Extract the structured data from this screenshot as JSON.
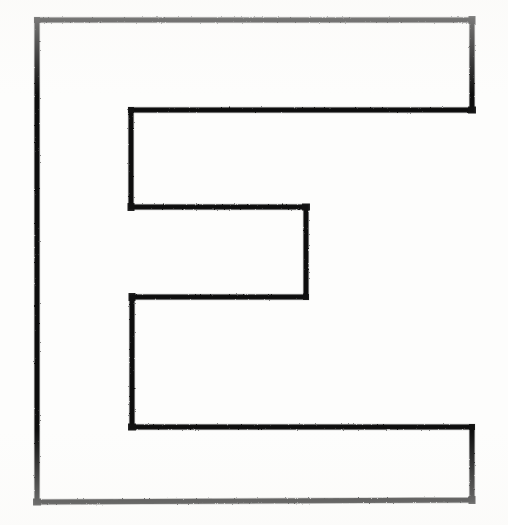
{
  "document": {
    "kind": "line-drawing",
    "title": "E-shaped outline polygon",
    "description": "Scanned black-ink outline of a comb / letter-E shaped closed polygon on white paper",
    "background_color": "#fdfdfc",
    "ink_color": "#1a1a1a",
    "canvas": {
      "width": 508,
      "height": 525
    }
  },
  "shape": {
    "name": "e-shape-polygon",
    "closed": true,
    "stroke_width": 5,
    "stroke_color": "#141414",
    "fill": "none",
    "points": [
      [
        37,
        20
      ],
      [
        472,
        20
      ],
      [
        472,
        110
      ],
      [
        131,
        110
      ],
      [
        131,
        207
      ],
      [
        306,
        207
      ],
      [
        306,
        297
      ],
      [
        132,
        297
      ],
      [
        132,
        427
      ],
      [
        472,
        427
      ],
      [
        472,
        500
      ],
      [
        37,
        502
      ]
    ],
    "segments": [
      {
        "name": "top-edge",
        "from": [
          37,
          20
        ],
        "to": [
          472,
          20
        ],
        "orientation": "horizontal"
      },
      {
        "name": "top-right-edge",
        "from": [
          472,
          20
        ],
        "to": [
          472,
          110
        ],
        "orientation": "vertical"
      },
      {
        "name": "upper-arm-underside",
        "from": [
          472,
          110
        ],
        "to": [
          131,
          110
        ],
        "orientation": "horizontal"
      },
      {
        "name": "upper-notch-left-edge",
        "from": [
          131,
          110
        ],
        "to": [
          131,
          207
        ],
        "orientation": "vertical"
      },
      {
        "name": "middle-arm-topside",
        "from": [
          131,
          207
        ],
        "to": [
          306,
          207
        ],
        "orientation": "horizontal"
      },
      {
        "name": "middle-arm-right-edge",
        "from": [
          306,
          207
        ],
        "to": [
          306,
          297
        ],
        "orientation": "vertical"
      },
      {
        "name": "middle-arm-underside",
        "from": [
          306,
          297
        ],
        "to": [
          132,
          297
        ],
        "orientation": "horizontal"
      },
      {
        "name": "lower-notch-left-edge",
        "from": [
          132,
          297
        ],
        "to": [
          132,
          427
        ],
        "orientation": "vertical"
      },
      {
        "name": "lower-arm-topside",
        "from": [
          132,
          427
        ],
        "to": [
          472,
          427
        ],
        "orientation": "horizontal"
      },
      {
        "name": "bottom-right-edge",
        "from": [
          472,
          427
        ],
        "to": [
          472,
          500
        ],
        "orientation": "vertical"
      },
      {
        "name": "bottom-edge",
        "from": [
          472,
          500
        ],
        "to": [
          37,
          502
        ],
        "orientation": "horizontal"
      },
      {
        "name": "left-spine-edge",
        "from": [
          37,
          502
        ],
        "to": [
          37,
          20
        ],
        "orientation": "vertical"
      }
    ]
  }
}
